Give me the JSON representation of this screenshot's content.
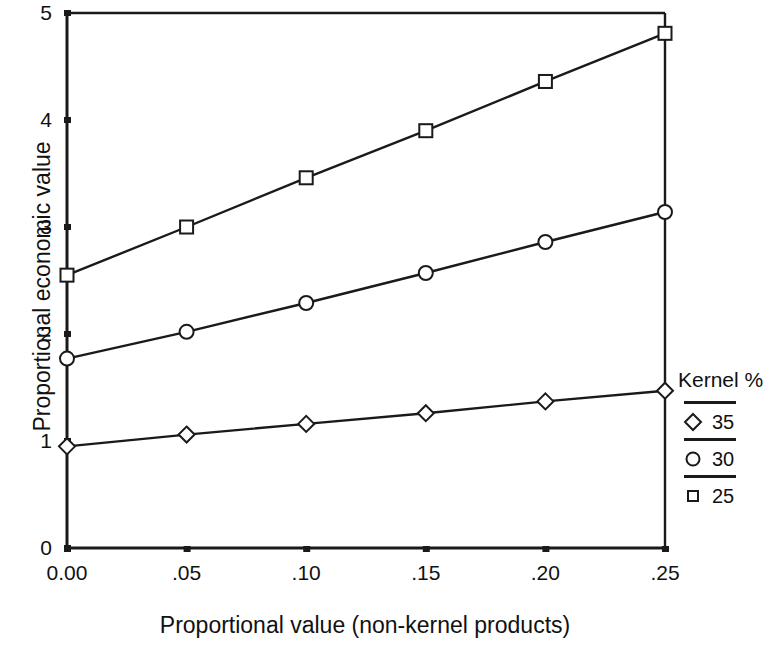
{
  "chart_data": {
    "type": "line",
    "title": "",
    "xlabel": "Proportional value (non-kernel products)",
    "ylabel": "Proportional economic value",
    "x": [
      0.0,
      0.05,
      0.1,
      0.15,
      0.2,
      0.25
    ],
    "xtick_labels": [
      "0.00",
      ".05",
      ".10",
      ".15",
      ".20",
      ".25"
    ],
    "ytick_labels": [
      "0",
      "1",
      "2",
      "3",
      "4",
      "5"
    ],
    "yticks": [
      0,
      1,
      2,
      3,
      4,
      5
    ],
    "xlim": [
      0.0,
      0.25
    ],
    "ylim": [
      0,
      5
    ],
    "grid": false,
    "legend_position": "right",
    "legend_title": "Kernel %",
    "series": [
      {
        "name": "25",
        "marker": "square",
        "values": [
          2.55,
          3.0,
          3.46,
          3.9,
          4.36,
          4.81
        ]
      },
      {
        "name": "30",
        "marker": "circle",
        "values": [
          1.77,
          2.02,
          2.29,
          2.57,
          2.86,
          3.14
        ]
      },
      {
        "name": "35",
        "marker": "diamond",
        "values": [
          0.95,
          1.06,
          1.16,
          1.26,
          1.37,
          1.47
        ]
      }
    ],
    "line_color": "#1a1a1a",
    "axis_color": "#1a1a1a"
  },
  "legend": {
    "title": "Kernel %",
    "entries": [
      {
        "label": "35",
        "marker": "diamond-marker"
      },
      {
        "label": "30",
        "marker": "circle-marker"
      },
      {
        "label": "25",
        "marker": "square-marker"
      }
    ]
  }
}
